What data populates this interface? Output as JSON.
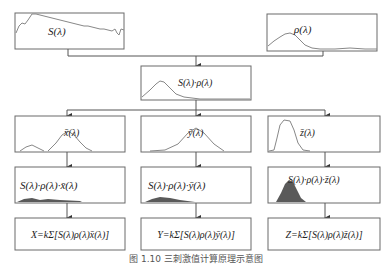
{
  "diagram": {
    "source": {
      "label": "S(λ)"
    },
    "reflectance": {
      "label": "ρ(λ)"
    },
    "product": {
      "label": "S(λ)·ρ(λ)"
    },
    "cmf": [
      {
        "label": "x̄(λ)",
        "channel": "x"
      },
      {
        "label": "ȳ(λ)",
        "channel": "y"
      },
      {
        "label": "z̄(λ)",
        "channel": "z"
      }
    ],
    "weighted": [
      {
        "label": "S(λ)·ρ(λ)·x̄(λ)"
      },
      {
        "label": "S(λ)·ρ(λ)·ȳ(λ)"
      },
      {
        "label": "S(λ)·ρ(λ)·z̄(λ)"
      }
    ],
    "results": [
      {
        "label": "X=kΣ[S(λ)ρ(λ)x̄(λ)]"
      },
      {
        "label": "Y=kΣ[S(λ)ρ(λ)ȳ(λ)]"
      },
      {
        "label": "Z=kΣ[S(λ)ρ(λ)z̄(λ)]"
      }
    ],
    "caption": "图 1.10  三刺激值计算原理示意图"
  }
}
